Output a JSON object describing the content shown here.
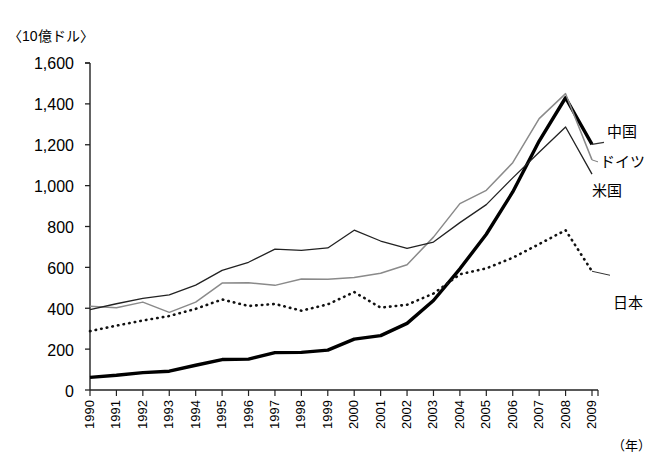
{
  "title_partial": "",
  "axis": {
    "unit_label": "〈10億ドル〉",
    "x_axis_name": "（年）",
    "y_ticks": [
      "1,600",
      "1,400",
      "1,200",
      "1,000",
      "800",
      "600",
      "400",
      "200",
      "0"
    ],
    "x_ticks": [
      "1990",
      "1991",
      "1992",
      "1993",
      "1994",
      "1995",
      "1996",
      "1997",
      "1998",
      "1999",
      "2000",
      "2001",
      "2002",
      "2003",
      "2004",
      "2005",
      "2006",
      "2007",
      "2008",
      "2009"
    ]
  },
  "series_labels": {
    "china": "中国",
    "germany": "ドイツ",
    "usa": "米国",
    "japan": "日本"
  },
  "chart_data": {
    "type": "line",
    "title": "",
    "xlabel": "（年）",
    "ylabel": "〈10億ドル〉",
    "ylim": [
      0,
      1600
    ],
    "ytick_step": 200,
    "grid": false,
    "legend_position": "inline-right",
    "x": [
      1990,
      1991,
      1992,
      1993,
      1994,
      1995,
      1996,
      1997,
      1998,
      1999,
      2000,
      2001,
      2002,
      2003,
      2004,
      2005,
      2006,
      2007,
      2008,
      2009
    ],
    "series": [
      {
        "name": "中国",
        "style": "thick-solid-black",
        "color": "#000000",
        "values": [
          62,
          72,
          85,
          92,
          121,
          149,
          151,
          183,
          184,
          195,
          249,
          266,
          326,
          438,
          593,
          762,
          969,
          1218,
          1430,
          1202
        ]
      },
      {
        "name": "ドイツ",
        "style": "thin-solid-gray",
        "color": "#8a8a8a",
        "values": [
          410,
          402,
          430,
          380,
          430,
          523,
          525,
          512,
          543,
          542,
          550,
          571,
          613,
          748,
          912,
          977,
          1112,
          1328,
          1450,
          1126
        ]
      },
      {
        "name": "米国",
        "style": "thin-solid-black",
        "color": "#222222",
        "values": [
          393,
          422,
          448,
          465,
          513,
          585,
          625,
          689,
          683,
          695,
          782,
          729,
          693,
          724,
          819,
          907,
          1038,
          1163,
          1287,
          1056
        ]
      },
      {
        "name": "日本",
        "style": "dotted-black",
        "color": "#111111",
        "values": [
          288,
          315,
          340,
          362,
          397,
          443,
          411,
          421,
          388,
          419,
          479,
          403,
          417,
          472,
          566,
          595,
          647,
          714,
          782,
          581
        ]
      }
    ]
  },
  "colors": {
    "axis": "#222222",
    "background": "#ffffff"
  }
}
